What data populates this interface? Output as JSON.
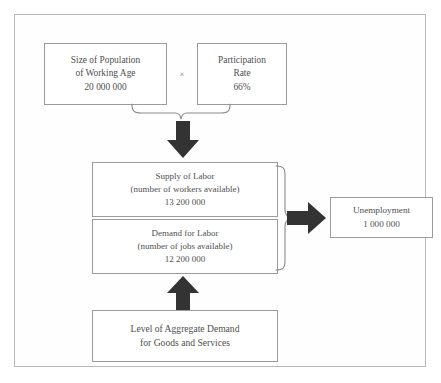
{
  "diagram": {
    "colors": {
      "frame_border": "#b9b9b9",
      "box_border": "#9b9b9b",
      "text": "#4f4f4f",
      "arrow_fill": "#333333",
      "brace_stroke": "#8a8a8a",
      "background": "#ffffff"
    },
    "nodes": {
      "population": {
        "line1": "Size of Population",
        "line2": "of Working Age",
        "line3": "20 000 000"
      },
      "operator": {
        "symbol": "×",
        "name": "multiplication-sign"
      },
      "participation": {
        "line1": "Participation",
        "line2": "Rate",
        "line3": "66%"
      },
      "supply": {
        "line1": "Supply of Labor",
        "line2": "(number of workers available)",
        "line3": "13 200 000"
      },
      "demand": {
        "line1": "Demand for Labor",
        "line2": "(number of jobs available)",
        "line3": "12 200 000"
      },
      "unemployment": {
        "line1": "Unemployment",
        "line2": "1 000 000"
      },
      "aggregate": {
        "line1": "Level of Aggregate Demand",
        "line2": "for Goods and Services"
      }
    },
    "connectors": {
      "brace_top": "brace-joining-population-and-participation",
      "arrow_down": "arrow-down-icon",
      "brace_right": "brace-joining-supply-and-demand",
      "arrow_right": "arrow-right-icon",
      "arrow_up": "arrow-up-icon"
    }
  }
}
